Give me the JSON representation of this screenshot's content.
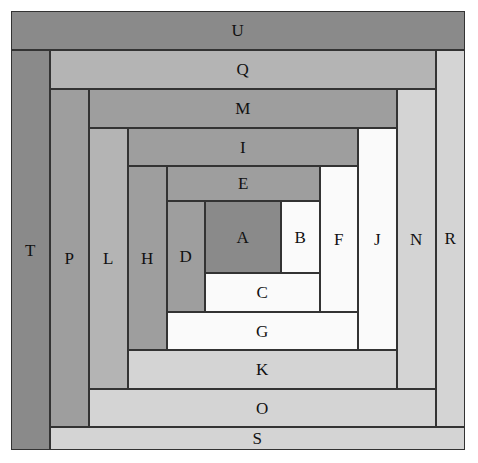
{
  "figure": {
    "background": "#ffffff",
    "stroke": "#333333",
    "canvas": {
      "width": 478,
      "height": 463
    },
    "grid": {
      "x": [
        11,
        50,
        89,
        128,
        167,
        205,
        281,
        320,
        358,
        397,
        436,
        465
      ],
      "y": [
        11,
        50,
        89,
        128,
        166,
        201,
        273,
        312,
        350,
        389,
        427,
        450
      ]
    },
    "palette": {
      "dark": "#8a8a8a",
      "mid_dark": "#9e9e9e",
      "mid": "#b4b4b4",
      "light": "#d4d4d4",
      "pale": "#e6e6e6",
      "white": "#fafafa"
    },
    "blocks": [
      {
        "label": "A",
        "x": 205,
        "y": 201,
        "w": 76,
        "h": 72,
        "color": "#8a8a8a"
      },
      {
        "label": "B",
        "x": 281,
        "y": 201,
        "w": 39,
        "h": 72,
        "color": "#fafafa"
      },
      {
        "label": "C",
        "x": 205,
        "y": 273,
        "w": 115,
        "h": 39,
        "color": "#fafafa"
      },
      {
        "label": "D",
        "x": 167,
        "y": 201,
        "w": 38,
        "h": 111,
        "color": "#9e9e9e"
      },
      {
        "label": "E",
        "x": 167,
        "y": 166,
        "w": 153,
        "h": 35,
        "color": "#9e9e9e"
      },
      {
        "label": "F",
        "x": 320,
        "y": 166,
        "w": 38,
        "h": 146,
        "color": "#fafafa"
      },
      {
        "label": "G",
        "x": 167,
        "y": 312,
        "w": 191,
        "h": 38,
        "color": "#fafafa"
      },
      {
        "label": "H",
        "x": 128,
        "y": 166,
        "w": 39,
        "h": 184,
        "color": "#9e9e9e"
      },
      {
        "label": "I",
        "x": 128,
        "y": 128,
        "w": 230,
        "h": 38,
        "color": "#9e9e9e"
      },
      {
        "label": "J",
        "x": 358,
        "y": 128,
        "w": 39,
        "h": 222,
        "color": "#fafafa"
      },
      {
        "label": "K",
        "x": 128,
        "y": 350,
        "w": 269,
        "h": 39,
        "color": "#d4d4d4"
      },
      {
        "label": "L",
        "x": 89,
        "y": 128,
        "w": 39,
        "h": 261,
        "color": "#b4b4b4"
      },
      {
        "label": "M",
        "x": 89,
        "y": 89,
        "w": 308,
        "h": 39,
        "color": "#9e9e9e"
      },
      {
        "label": "N",
        "x": 397,
        "y": 89,
        "w": 39,
        "h": 300,
        "color": "#d4d4d4"
      },
      {
        "label": "O",
        "x": 89,
        "y": 389,
        "w": 347,
        "h": 38,
        "color": "#d4d4d4"
      },
      {
        "label": "P",
        "x": 50,
        "y": 89,
        "w": 39,
        "h": 338,
        "color": "#9e9e9e"
      },
      {
        "label": "Q",
        "x": 50,
        "y": 50,
        "w": 386,
        "h": 39,
        "color": "#b4b4b4"
      },
      {
        "label": "R",
        "x": 436,
        "y": 50,
        "w": 29,
        "h": 377,
        "color": "#d4d4d4"
      },
      {
        "label": "S",
        "x": 50,
        "y": 427,
        "w": 415,
        "h": 23,
        "color": "#d4d4d4"
      },
      {
        "label": "T",
        "x": 11,
        "y": 50,
        "w": 39,
        "h": 400,
        "color": "#8a8a8a"
      },
      {
        "label": "U",
        "x": 11,
        "y": 11,
        "w": 454,
        "h": 39,
        "color": "#8a8a8a"
      }
    ]
  }
}
